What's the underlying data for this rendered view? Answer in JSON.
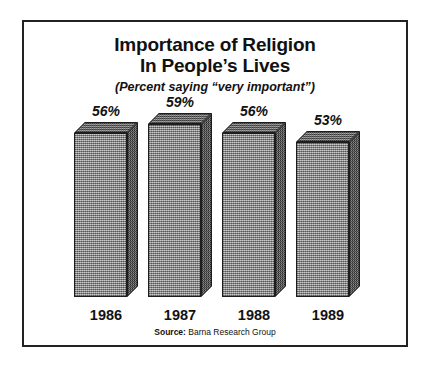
{
  "chart_data": {
    "type": "bar",
    "title_lines": [
      "Importance of Religion",
      "In People’s Lives"
    ],
    "subtitle": "(Percent saying “very important”)",
    "categories": [
      "1986",
      "1987",
      "1988",
      "1989"
    ],
    "values": [
      56,
      59,
      56,
      53
    ],
    "value_labels": [
      "56%",
      "59%",
      "56%",
      "53%"
    ],
    "xlabel": "",
    "ylabel": "",
    "ylim": [
      0,
      65
    ],
    "grid": false,
    "legend": "none",
    "source_key": "Source:",
    "source_value": "Barna Research Group",
    "colors": {
      "bar_front": "#9d9d9d",
      "bar_top": "#6f6f6f",
      "bar_side": "#5e5e5e",
      "outline": "#1d1d1d",
      "text": "#111111",
      "background": "#ffffff",
      "frame": "#222222"
    }
  }
}
